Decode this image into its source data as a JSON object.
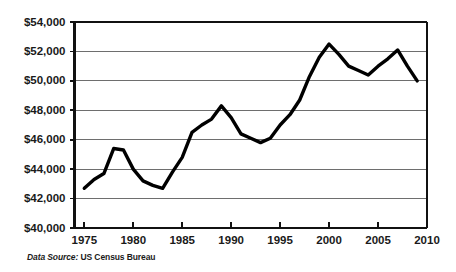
{
  "caption": {
    "label": "Data Source:",
    "value": "US Census Bureau"
  },
  "chart_data": {
    "type": "line",
    "title": "",
    "subtitle": "",
    "xlabel": "",
    "ylabel": "",
    "xlim": [
      1974,
      2010
    ],
    "ylim": [
      40000,
      54000
    ],
    "grid": true,
    "legend": null,
    "x_tick_labels": [
      "1975",
      "1980",
      "1985",
      "1990",
      "1995",
      "2000",
      "2005",
      "2010"
    ],
    "x_ticks": [
      1975,
      1980,
      1985,
      1990,
      1995,
      2000,
      2005,
      2010
    ],
    "y_tick_labels": [
      "$40,000",
      "$42,000",
      "$44,000",
      "$46,000",
      "$48,000",
      "$50,000",
      "$52,000",
      "$54,000"
    ],
    "y_ticks": [
      40000,
      42000,
      44000,
      46000,
      48000,
      50000,
      52000,
      54000
    ],
    "line_color": "#000000",
    "gridline_color": "#6e6e6e",
    "x": [
      1975,
      1976,
      1977,
      1978,
      1979,
      1980,
      1981,
      1982,
      1983,
      1984,
      1985,
      1986,
      1987,
      1988,
      1989,
      1990,
      1991,
      1992,
      1993,
      1994,
      1995,
      1996,
      1997,
      1998,
      1999,
      2000,
      2001,
      2002,
      2003,
      2004,
      2005,
      2006,
      2007,
      2008,
      2009
    ],
    "values": [
      42700,
      43300,
      43700,
      45400,
      45300,
      44000,
      43200,
      42900,
      42700,
      43800,
      44800,
      46500,
      47000,
      47400,
      48300,
      47500,
      46400,
      46100,
      45800,
      46100,
      47000,
      47700,
      48700,
      50300,
      51600,
      52500,
      51800,
      51000,
      50700,
      50400,
      51000,
      51500,
      52100,
      51000,
      50000
    ],
    "annotations": []
  }
}
